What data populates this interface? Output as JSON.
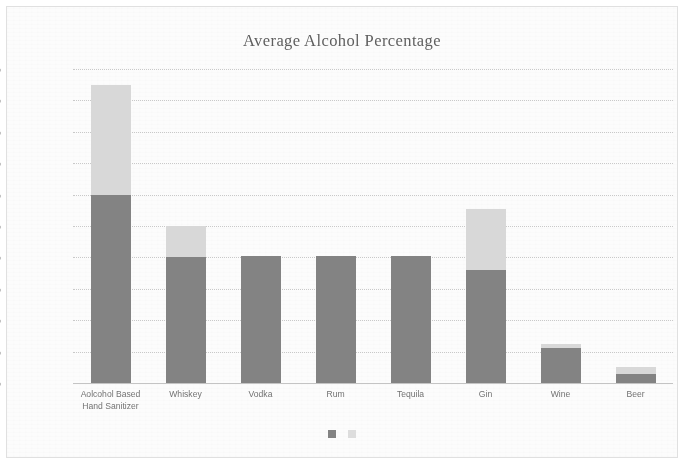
{
  "figure": {
    "title": "Average Alcohol Percentage",
    "border_color": "#e2e2e2",
    "background": "#ffffff"
  },
  "legend": {
    "position": "bottom-center",
    "items": [
      {
        "name": "series-1-swatch",
        "color": "#808080",
        "label": ""
      },
      {
        "name": "series-2-swatch",
        "color": "#dedede",
        "label": ""
      }
    ]
  },
  "axis": {
    "y_ticks": [
      "100.00%",
      "90.00%",
      "80.00%",
      "70.00%",
      "60.00%",
      "50.00%",
      "40.00%",
      "30.00%",
      "20.00%",
      "10.00%",
      "0.00%"
    ]
  },
  "chart_data": {
    "type": "bar",
    "stacked": true,
    "title": "Average Alcohol Percentage",
    "xlabel": "",
    "ylabel": "",
    "ylim": [
      0,
      100
    ],
    "ytick_values": [
      0,
      10,
      20,
      30,
      40,
      50,
      60,
      70,
      80,
      90,
      100
    ],
    "ytick_labels": [
      "0.00%",
      "10.00%",
      "20.00%",
      "30.00%",
      "40.00%",
      "50.00%",
      "60.00%",
      "70.00%",
      "80.00%",
      "90.00%",
      "100.00%"
    ],
    "grid": true,
    "legend_position": "bottom-center",
    "categories": [
      "Aolcohol Based Hand Sanitizer",
      "Whiskey",
      "Vodka",
      "Rum",
      "Tequila",
      "Gin",
      "Wine",
      "Beer"
    ],
    "category_lines": [
      [
        "Aolcohol Based",
        "Hand Sanitizer"
      ],
      [
        "Whiskey"
      ],
      [
        "Vodka"
      ],
      [
        "Rum"
      ],
      [
        "Tequila"
      ],
      [
        "Gin"
      ],
      [
        "Wine"
      ],
      [
        "Beer"
      ]
    ],
    "series": [
      {
        "name": "series-1",
        "color": "#808080",
        "values": [
          60.0,
          40.0,
          40.5,
          40.5,
          40.5,
          36.0,
          11.0,
          3.0
        ]
      },
      {
        "name": "series-2",
        "color": "#d9d9d9",
        "values": [
          35.0,
          10.0,
          0.0,
          0.0,
          0.0,
          19.5,
          1.5,
          2.0
        ]
      }
    ],
    "stack_totals": [
      95.0,
      50.0,
      40.5,
      40.5,
      40.5,
      55.5,
      12.5,
      5.0
    ]
  }
}
